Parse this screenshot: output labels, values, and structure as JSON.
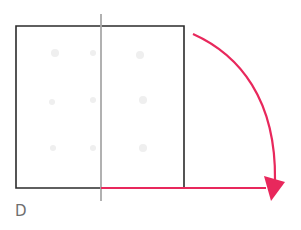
{
  "figure": {
    "label": "D",
    "colors": {
      "square_stroke": "#2b2b2b",
      "fold_line": "#a9a9a9",
      "arrow": "#e8285c",
      "ghost_marks": "#eeeeee",
      "label": "#6f6f6f"
    },
    "square": {
      "x": 16,
      "y": 26,
      "width": 168,
      "height": 162
    },
    "fold_line": {
      "x": 101,
      "y1": 14,
      "y2": 201
    },
    "bottom_extension": {
      "x1": 101,
      "x2": 265,
      "y": 188
    },
    "arc_arrow": {
      "start": [
        193,
        34
      ],
      "end": [
        274,
        180
      ],
      "arrowhead_tip": [
        271,
        200
      ]
    }
  }
}
